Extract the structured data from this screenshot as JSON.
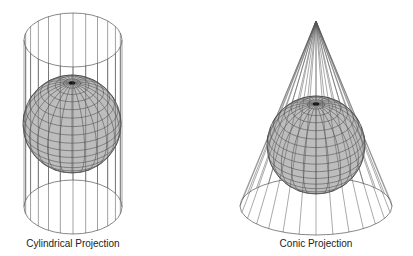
{
  "diagram": {
    "background": "#ffffff",
    "line_color": "#555555",
    "globe_fill": "#bdbdbd",
    "globe_grid_color": "#4a4a4a",
    "tilt_deg": 33,
    "meridians": 24,
    "parallels_step_deg": 10
  },
  "cylindrical": {
    "label": "Cylindrical Projection",
    "label_pos": [
      73,
      238
    ],
    "cylinder": {
      "cx": 73,
      "rx": 49,
      "ry": 27,
      "top_cy": 40,
      "bottom_cy": 207,
      "lines": 24
    },
    "globe": {
      "cx": 72,
      "cy": 124,
      "r": 49
    }
  },
  "conic": {
    "label": "Conic Projection",
    "label_pos": [
      316,
      238
    ],
    "cone": {
      "apex": [
        316,
        21
      ],
      "base_cx": 316,
      "base_cy": 206,
      "rx": 76,
      "ry": 29,
      "lines": 28
    },
    "globe": {
      "cx": 316,
      "cy": 145,
      "r": 49
    }
  }
}
